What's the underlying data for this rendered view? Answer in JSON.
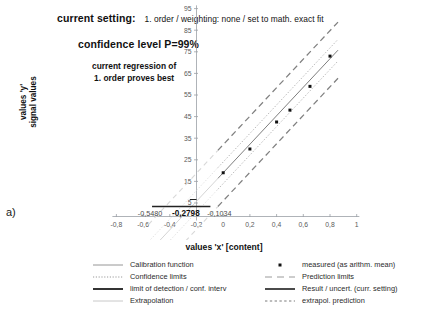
{
  "panel": {
    "label": "a)"
  },
  "annotations": {
    "setting_label": "current setting:",
    "setting_value": "1. order / weighting: none / set to math. exact fit",
    "confidence_level": "confidence level P=99%",
    "regression_note_line1": "current regression of",
    "regression_note_line2": "1. order proves best"
  },
  "chart_data": {
    "type": "scatter",
    "title": "",
    "xlabel": "values 'x' [content]",
    "ylabel": "values 'y'\nsignal values",
    "ylabel_line1": "values 'y'",
    "ylabel_line2": "signal values",
    "xlim": [
      -0.8,
      1.0
    ],
    "ylim": [
      0,
      95
    ],
    "xticks": [
      -0.8,
      -0.6,
      -0.4,
      -0.2,
      0,
      0.2,
      0.4,
      0.6,
      0.8,
      1
    ],
    "xticklabels": [
      "-0,8",
      "-0,6",
      "-0,4",
      "-0,2",
      "0",
      "0,2",
      "0,4",
      "0,6",
      "0,8",
      "1"
    ],
    "yticks": [
      5,
      15,
      25,
      35,
      45,
      55,
      65,
      75,
      85,
      95
    ],
    "yticklabels": [
      "5",
      "15",
      "25",
      "35",
      "45",
      "55",
      "65",
      "75",
      "85",
      "95"
    ],
    "grid": false,
    "legend_position": "bottom",
    "axis_annotations": [
      {
        "name": "extrapolation-limit",
        "value": "-0,5480",
        "x": -0.548,
        "bold": false
      },
      {
        "name": "limit-of-detection",
        "value": "-0,2798",
        "x": -0.2798,
        "bold": true
      },
      {
        "name": "confidence-interval",
        "value": "-0,1034",
        "x": -0.1034,
        "bold": false
      }
    ],
    "series": [
      {
        "name": "measured (as arithm. mean)",
        "type": "scatter",
        "x": [
          0.0,
          0.2,
          0.4,
          0.5,
          0.65,
          0.8
        ],
        "y": [
          19.0,
          30.0,
          42.5,
          48.0,
          59.0,
          73.0
        ]
      },
      {
        "name": "Calibration function",
        "type": "line",
        "slope": 66.0,
        "intercept": 19.0,
        "x": [
          0.0,
          0.85
        ],
        "y": [
          19.0,
          75.1
        ]
      },
      {
        "name": "Confidence limits",
        "type": "line-pair",
        "offset": 5.0
      },
      {
        "name": "Prediction limits",
        "type": "line-pair",
        "offset": 13.0
      },
      {
        "name": "Extrapolation",
        "type": "line",
        "x": [
          -0.548,
          0.0
        ],
        "y": [
          -17.2,
          19.0
        ]
      },
      {
        "name": "extrapol. prediction",
        "type": "line-pair",
        "offset": 13.0
      }
    ]
  },
  "legend": {
    "left_column": [
      {
        "key": "solid-thin",
        "label": "Calibration function"
      },
      {
        "key": "dotted",
        "label": "Confidence limits"
      },
      {
        "key": "solid-thick",
        "label": "limit of detection / conf. interv"
      },
      {
        "key": "solid-light",
        "label": "Extrapolation"
      }
    ],
    "right_column": [
      {
        "key": "marker-dot",
        "label": "measured (as arithm. mean)"
      },
      {
        "key": "dashed-light",
        "label": "Prediction limits"
      },
      {
        "key": "solid-dark",
        "label": "Result / uncert. (curr. setting)"
      },
      {
        "key": "dotted-small",
        "label": "extrapol. prediction"
      }
    ]
  },
  "colors": {
    "axis": "#9aa0a6",
    "text": "#1a1a1a",
    "calibration": "#6f6f6f",
    "confidence": "#b8b8b8",
    "prediction": "#808080",
    "extrapolation": "#cfcfcf",
    "marker": "#111111",
    "limit_line": "#222222"
  }
}
